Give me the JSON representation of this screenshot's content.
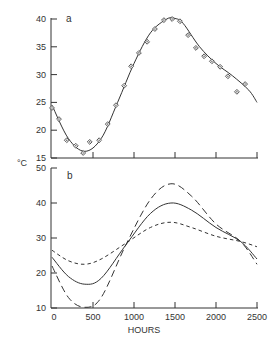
{
  "chart_data": [
    {
      "panel": "a",
      "type": "scatter",
      "title": "",
      "panel_label": "a",
      "xlabel": "HOURS",
      "ylabel": "°C",
      "xlim": [
        0,
        2500
      ],
      "ylim": [
        15,
        40
      ],
      "yticks": [
        15,
        20,
        25,
        30,
        35,
        40
      ],
      "xticks": [
        0,
        500,
        1000,
        1500,
        2000,
        2500
      ],
      "grid": false,
      "series": [
        {
          "name": "observed",
          "style": "open-diamond-markers",
          "x": [
            0,
            85,
            180,
            290,
            380,
            460,
            575,
            680,
            780,
            880,
            965,
            1060,
            1160,
            1255,
            1365,
            1465,
            1560,
            1660,
            1755,
            1855,
            1950,
            2050,
            2145,
            2255,
            2355
          ],
          "y": [
            24,
            22,
            18.2,
            17.2,
            15.9,
            17.9,
            18.2,
            21.1,
            24.5,
            28,
            31.5,
            33.9,
            35.9,
            38.2,
            39.8,
            40,
            39.6,
            37.1,
            34.8,
            33.3,
            32.4,
            31.4,
            29.7,
            26.9,
            28.3
          ]
        },
        {
          "name": "fitted curve",
          "style": "solid-line",
          "x": [
            0,
            200,
            400,
            600,
            800,
            1000,
            1200,
            1400,
            1500,
            1600,
            1800,
            2000,
            2200,
            2400,
            2500
          ],
          "y": [
            24.5,
            18.5,
            16.2,
            18.5,
            25,
            32,
            37.5,
            40,
            40.1,
            39.2,
            35,
            32,
            29.8,
            27.2,
            25
          ]
        }
      ]
    },
    {
      "panel": "b",
      "type": "line",
      "title": "",
      "panel_label": "b",
      "xlabel": "HOURS",
      "ylabel": "°C",
      "xlim": [
        0,
        2500
      ],
      "ylim": [
        10,
        50
      ],
      "yticks": [
        10,
        20,
        30,
        40,
        50
      ],
      "xticks": [
        0,
        500,
        1000,
        1500,
        2000,
        2500
      ],
      "xtick_labels": [
        "0",
        "500",
        "1000",
        "1500",
        "2000",
        "2500"
      ],
      "grid": false,
      "series": [
        {
          "name": "solid",
          "style": "solid",
          "x": [
            0,
            200,
            400,
            600,
            900,
            1200,
            1450,
            1700,
            2000,
            2300,
            2500
          ],
          "y": [
            24.5,
            19,
            16.8,
            18.5,
            28,
            37,
            40,
            38,
            33,
            29,
            24
          ]
        },
        {
          "name": "long-dash",
          "style": "long-dash",
          "x": [
            0,
            200,
            400,
            600,
            900,
            1200,
            1450,
            1700,
            2000,
            2300,
            2500
          ],
          "y": [
            22,
            13,
            10.2,
            13,
            28,
            41,
            45.5,
            42,
            34,
            29,
            22.5
          ]
        },
        {
          "name": "short-dash",
          "style": "short-dash",
          "x": [
            0,
            200,
            400,
            600,
            900,
            1200,
            1450,
            1700,
            2000,
            2300,
            2500
          ],
          "y": [
            26.5,
            23.5,
            22.5,
            24,
            28.5,
            33,
            34.5,
            33,
            30.5,
            29,
            27.5
          ]
        }
      ]
    }
  ],
  "labels": {
    "panel_a": "a",
    "panel_b": "b",
    "y_unit": "°C",
    "x_title": "HOURS",
    "a_yticks": [
      "15",
      "20",
      "25",
      "30",
      "35",
      "40"
    ],
    "b_yticks": [
      "10",
      "20",
      "30",
      "40",
      "50"
    ],
    "xticks": [
      "0",
      "500",
      "1000",
      "1500",
      "2000",
      "2500"
    ]
  }
}
